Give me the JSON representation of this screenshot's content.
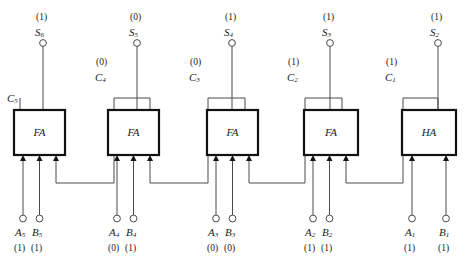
{
  "diagram": {
    "colors": {
      "wire": "#4a4a4a",
      "box_border": "#111111",
      "text": "#1a1a1a",
      "background": "#ffffff"
    },
    "stages": [
      {
        "id": "stage-5",
        "block_label": "FA",
        "block_type": "full-adder",
        "sum_label": "S",
        "sum_subscript": "6",
        "sum_value": "(1)",
        "carry_out_label": "C",
        "carry_out_subscript": "5",
        "carry_out_value": "",
        "inputs": [
          {
            "label": "A",
            "subscript": "5",
            "value": "(1)"
          },
          {
            "label": "B",
            "subscript": "5",
            "value": "(1)"
          }
        ]
      },
      {
        "id": "stage-4",
        "block_label": "FA",
        "block_type": "full-adder",
        "sum_label": "S",
        "sum_subscript": "5",
        "sum_value": "(0)",
        "carry_out_label": "C",
        "carry_out_subscript": "4",
        "carry_out_value": "(0)",
        "inputs": [
          {
            "label": "A",
            "subscript": "4",
            "value": "(0)"
          },
          {
            "label": "B",
            "subscript": "4",
            "value": "(1)"
          }
        ]
      },
      {
        "id": "stage-3",
        "block_label": "FA",
        "block_type": "full-adder",
        "sum_label": "S",
        "sum_subscript": "4",
        "sum_value": "(1)",
        "carry_out_label": "C",
        "carry_out_subscript": "3",
        "carry_out_value": "(0)",
        "inputs": [
          {
            "label": "A",
            "subscript": "3",
            "value": "(0)"
          },
          {
            "label": "B",
            "subscript": "3",
            "value": "(0)"
          }
        ]
      },
      {
        "id": "stage-2",
        "block_label": "FA",
        "block_type": "full-adder",
        "sum_label": "S",
        "sum_subscript": "3",
        "sum_value": "(1)",
        "carry_out_label": "C",
        "carry_out_subscript": "2",
        "carry_out_value": "(1)",
        "inputs": [
          {
            "label": "A",
            "subscript": "2",
            "value": "(1)"
          },
          {
            "label": "B",
            "subscript": "2",
            "value": "(1)"
          }
        ]
      },
      {
        "id": "stage-1",
        "block_label": "HA",
        "block_type": "half-adder",
        "sum_label": "S",
        "sum_subscript": "2",
        "sum_value": "(1)",
        "carry_out_label": "C",
        "carry_out_subscript": "1",
        "carry_out_value": "(1)",
        "inputs": [
          {
            "label": "A",
            "subscript": "1",
            "value": "(1)"
          },
          {
            "label": "B",
            "subscript": "1",
            "value": "(1)"
          }
        ]
      }
    ],
    "rightmost_sum": {
      "label": "S",
      "subscript": "1",
      "value": "(0)"
    }
  }
}
